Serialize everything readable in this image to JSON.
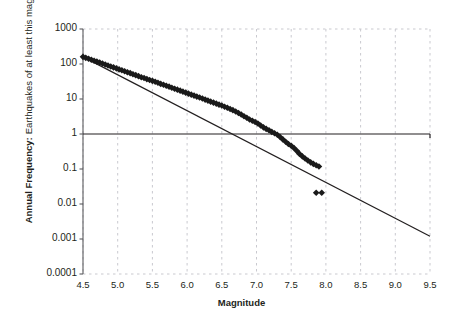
{
  "figure": {
    "top_fragment": "",
    "background_color": "#ffffff",
    "marker_color": "#1a1a1a",
    "line_color": "#231f20",
    "grid_color": "#c9c9cf"
  },
  "axes": {
    "x": {
      "label": "Magnitude",
      "scale": "linear",
      "min": 4.5,
      "max": 9.5,
      "ticks": [
        "4.5",
        "5.0",
        "5.5",
        "6.0",
        "6.5",
        "7.0",
        "7.5",
        "8.0",
        "8.5",
        "9.0",
        "9.5"
      ],
      "tick_values": [
        4.5,
        5.0,
        5.5,
        6.0,
        6.5,
        7.0,
        7.5,
        8.0,
        8.5,
        9.0,
        9.5
      ]
    },
    "y": {
      "label_line1": "Annual Frequency:",
      "label_line2": "Earthquakes of at least this magnitude",
      "scale": "log",
      "min": 0.0001,
      "max": 1000,
      "ticks": [
        "1000",
        "100",
        "10",
        "1",
        "0.1",
        "0.01",
        "0.001",
        "0.0001"
      ],
      "tick_values": [
        1000,
        100,
        10,
        1,
        0.1,
        0.01,
        0.001,
        0.0001
      ]
    }
  },
  "chart_data": {
    "type": "scatter",
    "title": "",
    "subtitle": "",
    "xlabel": "Magnitude",
    "ylabel": "Annual Frequency: Earthquakes of at least this magnitude",
    "xlim": [
      4.5,
      9.5
    ],
    "ylim": [
      0.0001,
      1000
    ],
    "yscale": "log",
    "xscale": "linear",
    "grid": "vertical dashed gridlines at every x tick; dashed top and bottom borders",
    "legend": "none",
    "annotations": [
      {
        "kind": "reference-line",
        "orientation": "horizontal",
        "y": 1,
        "style": "solid",
        "description": "Solid horizontal reference line at annual frequency = 1"
      }
    ],
    "series": [
      {
        "name": "Observed cumulative annual frequency",
        "type": "scatter",
        "marker": "diamond",
        "color": "#1a1a1a",
        "points": [
          [
            4.5,
            160.0
          ],
          [
            4.54,
            150.0
          ],
          [
            4.58,
            141.0
          ],
          [
            4.62,
            132.0
          ],
          [
            4.66,
            124.0
          ],
          [
            4.7,
            117.0
          ],
          [
            4.74,
            110.0
          ],
          [
            4.78,
            103.0
          ],
          [
            4.82,
            97.0
          ],
          [
            4.86,
            91.0
          ],
          [
            4.9,
            85.0
          ],
          [
            4.94,
            80.0
          ],
          [
            4.98,
            75.0
          ],
          [
            5.02,
            70.0
          ],
          [
            5.06,
            66.0
          ],
          [
            5.1,
            62.0
          ],
          [
            5.14,
            58.0
          ],
          [
            5.18,
            55.0
          ],
          [
            5.22,
            51.0
          ],
          [
            5.26,
            48.0
          ],
          [
            5.3,
            45.0
          ],
          [
            5.34,
            42.0
          ],
          [
            5.38,
            40.0
          ],
          [
            5.42,
            37.0
          ],
          [
            5.46,
            35.0
          ],
          [
            5.5,
            33.0
          ],
          [
            5.54,
            31.0
          ],
          [
            5.58,
            29.0
          ],
          [
            5.62,
            27.0
          ],
          [
            5.66,
            25.5
          ],
          [
            5.7,
            24.0
          ],
          [
            5.74,
            22.5
          ],
          [
            5.78,
            21.0
          ],
          [
            5.82,
            19.7
          ],
          [
            5.86,
            18.5
          ],
          [
            5.9,
            17.3
          ],
          [
            5.94,
            16.2
          ],
          [
            5.98,
            15.2
          ],
          [
            6.02,
            14.2
          ],
          [
            6.06,
            13.3
          ],
          [
            6.1,
            12.5
          ],
          [
            6.14,
            11.7
          ],
          [
            6.18,
            11.0
          ],
          [
            6.22,
            10.3
          ],
          [
            6.26,
            9.6
          ],
          [
            6.3,
            9.0
          ],
          [
            6.34,
            8.4
          ],
          [
            6.38,
            7.9
          ],
          [
            6.42,
            7.4
          ],
          [
            6.46,
            6.9
          ],
          [
            6.5,
            6.5
          ],
          [
            6.54,
            6.0
          ],
          [
            6.58,
            5.6
          ],
          [
            6.62,
            5.2
          ],
          [
            6.66,
            4.8
          ],
          [
            6.7,
            4.4
          ],
          [
            6.74,
            4.0
          ],
          [
            6.78,
            3.6
          ],
          [
            6.82,
            3.2
          ],
          [
            6.86,
            2.9
          ],
          [
            6.9,
            2.6
          ],
          [
            6.94,
            2.4
          ],
          [
            6.98,
            2.2
          ],
          [
            7.02,
            2.0
          ],
          [
            7.06,
            1.75
          ],
          [
            7.1,
            1.55
          ],
          [
            7.14,
            1.4
          ],
          [
            7.18,
            1.28
          ],
          [
            7.22,
            1.15
          ],
          [
            7.26,
            1.05
          ],
          [
            7.3,
            0.95
          ],
          [
            7.34,
            0.82
          ],
          [
            7.38,
            0.7
          ],
          [
            7.42,
            0.6
          ],
          [
            7.46,
            0.52
          ],
          [
            7.5,
            0.46
          ],
          [
            7.54,
            0.4
          ],
          [
            7.58,
            0.33
          ],
          [
            7.62,
            0.27
          ],
          [
            7.66,
            0.23
          ],
          [
            7.7,
            0.2
          ],
          [
            7.74,
            0.175
          ],
          [
            7.78,
            0.155
          ],
          [
            7.82,
            0.14
          ],
          [
            7.86,
            0.128
          ],
          [
            7.9,
            0.118
          ],
          [
            7.86,
            0.021
          ],
          [
            7.94,
            0.021
          ]
        ]
      },
      {
        "name": "Gutenberg-Richter fit",
        "type": "line",
        "color": "#231f20",
        "endpoints": [
          [
            4.5,
            160.0
          ],
          [
            9.5,
            0.0012
          ]
        ]
      }
    ]
  }
}
